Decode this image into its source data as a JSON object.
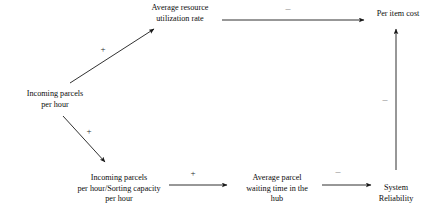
{
  "diagram": {
    "type": "causal-loop-diagram",
    "title": "",
    "nodes": [
      {
        "id": "avg-resource-utilization-rate",
        "label": "Average resource utilization rate",
        "lines": [
          "Average resource",
          "utilization rate"
        ],
        "x": 180,
        "y": 14
      },
      {
        "id": "per-item-cost",
        "label": "Per item cost",
        "lines": [
          "Per item cost"
        ],
        "x": 398,
        "y": 14
      },
      {
        "id": "incoming-parcels-per-hour",
        "label": "Incoming parcels per hour",
        "lines": [
          "Incoming parcels",
          "per hour"
        ],
        "x": 55,
        "y": 100
      },
      {
        "id": "incoming-parcels-over-sorting-capacity",
        "label": "Incoming parcels per hour/Sorting capacity per hour",
        "lines": [
          "Incoming parcels",
          "per hour/Sorting capacity",
          "per hour"
        ],
        "x": 119,
        "y": 189
      },
      {
        "id": "average-parcel-waiting-time",
        "label": "Average parcel waiting time in the hub",
        "lines": [
          "Average parcel",
          "waiting time in the",
          "hub"
        ],
        "x": 277,
        "y": 189
      },
      {
        "id": "system-reliability",
        "label": "System Reliability",
        "lines": [
          "System",
          "Reliability"
        ],
        "x": 396,
        "y": 194
      }
    ],
    "links": [
      {
        "id": "link-parcels-to-utilization",
        "from": "incoming-parcels-per-hour",
        "to": "avg-resource-utilization-rate",
        "polarity": "+",
        "polarity_x": 103,
        "polarity_y": 50
      },
      {
        "id": "link-utilization-to-cost",
        "from": "avg-resource-utilization-rate",
        "to": "per-item-cost",
        "polarity": "–",
        "polarity_x": 288,
        "polarity_y": 9
      },
      {
        "id": "link-parcels-to-ratio",
        "from": "incoming-parcels-per-hour",
        "to": "incoming-parcels-over-sorting-capacity",
        "polarity": "+",
        "polarity_x": 89,
        "polarity_y": 132
      },
      {
        "id": "link-ratio-to-waiting-time",
        "from": "incoming-parcels-over-sorting-capacity",
        "to": "average-parcel-waiting-time",
        "polarity": "+",
        "polarity_x": 193,
        "polarity_y": 174
      },
      {
        "id": "link-waiting-time-to-reliability",
        "from": "average-parcel-waiting-time",
        "to": "system-reliability",
        "polarity": "–",
        "polarity_x": 338,
        "polarity_y": 172
      },
      {
        "id": "link-reliability-to-cost",
        "from": "system-reliability",
        "to": "per-item-cost",
        "polarity": "–",
        "polarity_x": 385,
        "polarity_y": 100
      }
    ],
    "colors": {
      "stroke": "#1a1a1a",
      "text": "#0d0d0d",
      "background": "#ffffff",
      "polarity_minus": "#8f8f8f"
    }
  }
}
